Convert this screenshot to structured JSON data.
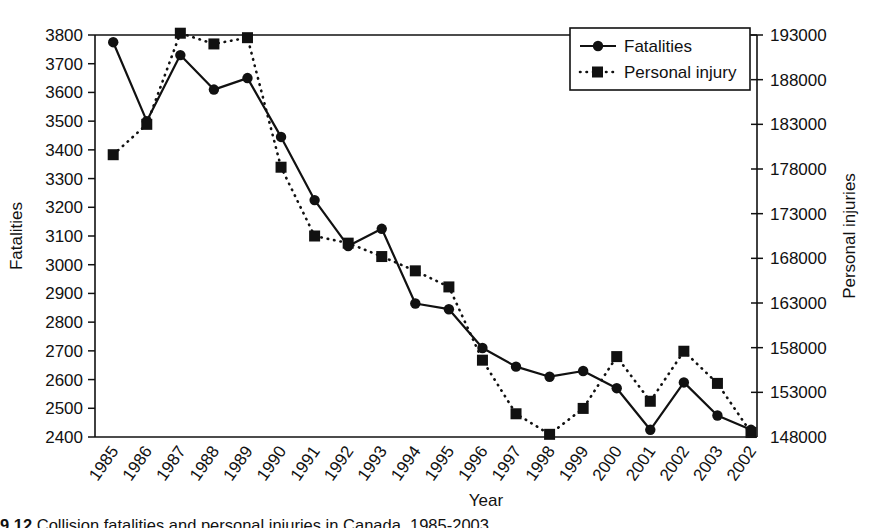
{
  "chart_data": {
    "type": "line",
    "title": "",
    "xlabel": "Year",
    "ylabel": "Fatalities",
    "y2label": "Personal injuries",
    "grid": false,
    "legend_position": "top-right",
    "categories": [
      "1985",
      "1986",
      "1987",
      "1988",
      "1989",
      "1990",
      "1991",
      "1992",
      "1993",
      "1994",
      "1995",
      "1996",
      "1997",
      "1998",
      "1999",
      "2000",
      "2001",
      "2002",
      "2003",
      "2002"
    ],
    "ylim": [
      2400,
      3800
    ],
    "yticks": [
      2400,
      2500,
      2600,
      2700,
      2800,
      2900,
      3000,
      3100,
      3200,
      3300,
      3400,
      3500,
      3600,
      3700,
      3800
    ],
    "y2lim": [
      148000,
      193000
    ],
    "y2ticks": [
      148000,
      153000,
      158000,
      163000,
      168000,
      173000,
      178000,
      183000,
      188000,
      193000
    ],
    "series": [
      {
        "name": "Fatalities",
        "axis": "left",
        "marker": "circle",
        "line": "solid",
        "color": "#111111",
        "values": [
          3775,
          3500,
          3730,
          3610,
          3650,
          3445,
          3225,
          3065,
          3125,
          2865,
          2845,
          2710,
          2645,
          2610,
          2630,
          2570,
          2425,
          2590,
          2475,
          2425
        ]
      },
      {
        "name": "Personal injury",
        "axis": "right",
        "marker": "square",
        "line": "dotted",
        "color": "#111111",
        "values": [
          179600,
          183000,
          193200,
          192000,
          192700,
          178200,
          170500,
          169700,
          168200,
          166600,
          164800,
          156600,
          150600,
          148300,
          151200,
          157000,
          152000,
          157600,
          154000,
          148500
        ]
      }
    ]
  },
  "legend": {
    "items": [
      {
        "label": "Fatalities",
        "marker": "circle",
        "line": "solid"
      },
      {
        "label": "Personal injury",
        "marker": "square",
        "line": "dotted"
      }
    ]
  },
  "caption": {
    "number": "9.12",
    "text": "Collision fatalities and personal injuries in Canada, 1985-2003"
  }
}
